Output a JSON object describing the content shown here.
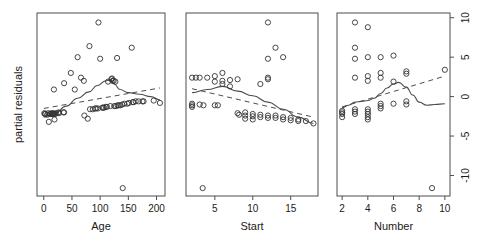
{
  "figure": {
    "ylabel": "partial residuals",
    "panels": [
      {
        "name": "age",
        "xlabel": "Age",
        "xticks": [
          "0",
          "50",
          "100",
          "150",
          "200"
        ],
        "xtick_values": [
          0,
          50,
          100,
          150,
          200
        ],
        "xlim": [
          -12,
          215
        ],
        "show_yaxis": false
      },
      {
        "name": "start",
        "xlabel": "Start",
        "xticks": [
          "5",
          "10",
          "15"
        ],
        "xtick_values": [
          5,
          10,
          15
        ],
        "xlim": [
          1.2,
          18.6
        ],
        "show_yaxis": false
      },
      {
        "name": "number",
        "xlabel": "Number",
        "xticks": [
          "2",
          "4",
          "6",
          "8",
          "10"
        ],
        "xtick_values": [
          2,
          4,
          6,
          8,
          10
        ],
        "xlim": [
          1.6,
          10.4
        ],
        "show_yaxis": true
      }
    ],
    "yticks": [
      "10",
      "5",
      "0",
      "-5",
      "-10"
    ],
    "ytick_values": [
      10,
      5,
      0,
      -5,
      -10
    ],
    "ylim": [
      -12.6,
      10.6
    ]
  },
  "chart_data": [
    {
      "type": "scatter",
      "title": "",
      "xlabel": "Age",
      "ylabel": "partial residuals",
      "xlim": [
        -12,
        215
      ],
      "ylim": [
        -12.6,
        10.6
      ],
      "grid": false,
      "legend": null,
      "marker": "open-circle",
      "points": [
        {
          "x": 1,
          "y": -2.1
        },
        {
          "x": 2,
          "y": -2.2
        },
        {
          "x": 3,
          "y": -2.2
        },
        {
          "x": 6,
          "y": -2.3
        },
        {
          "x": 8,
          "y": -2.1
        },
        {
          "x": 9,
          "y": -3.2
        },
        {
          "x": 11,
          "y": -2.2
        },
        {
          "x": 12,
          "y": -2.2
        },
        {
          "x": 14,
          "y": -2.1
        },
        {
          "x": 15,
          "y": -2.2
        },
        {
          "x": 16,
          "y": -2.2
        },
        {
          "x": 17,
          "y": -2.1
        },
        {
          "x": 18,
          "y": -2.2
        },
        {
          "x": 19,
          "y": -2.9
        },
        {
          "x": 20,
          "y": -2.2
        },
        {
          "x": 22,
          "y": -2.1
        },
        {
          "x": 26,
          "y": -2.0
        },
        {
          "x": 27,
          "y": -2.1
        },
        {
          "x": 35,
          "y": -2.0
        },
        {
          "x": 36,
          "y": -2.0
        },
        {
          "x": 18,
          "y": 0.9
        },
        {
          "x": 36,
          "y": 1.7
        },
        {
          "x": 48,
          "y": 3.0
        },
        {
          "x": 55,
          "y": 0.9
        },
        {
          "x": 60,
          "y": 5.0
        },
        {
          "x": 66,
          "y": 2.4
        },
        {
          "x": 71,
          "y": 2.0
        },
        {
          "x": 72,
          "y": -2.4
        },
        {
          "x": 78,
          "y": -2.8
        },
        {
          "x": 81,
          "y": 6.4
        },
        {
          "x": 82,
          "y": -1.6
        },
        {
          "x": 87,
          "y": -1.6
        },
        {
          "x": 91,
          "y": -1.5
        },
        {
          "x": 93,
          "y": -1.5
        },
        {
          "x": 96,
          "y": -1.5
        },
        {
          "x": 97,
          "y": 9.4
        },
        {
          "x": 100,
          "y": 4.8
        },
        {
          "x": 104,
          "y": -1.4
        },
        {
          "x": 105,
          "y": -1.4
        },
        {
          "x": 107,
          "y": -1.4
        },
        {
          "x": 110,
          "y": -1.3
        },
        {
          "x": 112,
          "y": -1.3
        },
        {
          "x": 114,
          "y": 1.9
        },
        {
          "x": 118,
          "y": -1.2
        },
        {
          "x": 120,
          "y": 2.2
        },
        {
          "x": 121,
          "y": 2.3
        },
        {
          "x": 122,
          "y": 2.0
        },
        {
          "x": 124,
          "y": 2.0
        },
        {
          "x": 125,
          "y": -1.2
        },
        {
          "x": 127,
          "y": 1.9
        },
        {
          "x": 128,
          "y": -1.2
        },
        {
          "x": 130,
          "y": 4.9
        },
        {
          "x": 131,
          "y": -1.1
        },
        {
          "x": 133,
          "y": -1.1
        },
        {
          "x": 136,
          "y": -1.1
        },
        {
          "x": 139,
          "y": -1.0
        },
        {
          "x": 140,
          "y": -11.6
        },
        {
          "x": 143,
          "y": -0.9
        },
        {
          "x": 148,
          "y": -0.9
        },
        {
          "x": 151,
          "y": -0.8
        },
        {
          "x": 156,
          "y": 6.2
        },
        {
          "x": 158,
          "y": -0.7
        },
        {
          "x": 159,
          "y": -0.7
        },
        {
          "x": 163,
          "y": -0.6
        },
        {
          "x": 168,
          "y": -0.6
        },
        {
          "x": 175,
          "y": -0.6
        },
        {
          "x": 177,
          "y": -0.6
        },
        {
          "x": 195,
          "y": -0.5
        },
        {
          "x": 206,
          "y": -0.8
        }
      ],
      "smooth_curve": [
        {
          "x": 0,
          "y": -2.6
        },
        {
          "x": 20,
          "y": -2.1
        },
        {
          "x": 40,
          "y": -1.2
        },
        {
          "x": 60,
          "y": -0.2
        },
        {
          "x": 80,
          "y": 0.6
        },
        {
          "x": 95,
          "y": 1.4
        },
        {
          "x": 110,
          "y": 2.0
        },
        {
          "x": 118,
          "y": 2.1
        },
        {
          "x": 125,
          "y": 1.6
        },
        {
          "x": 135,
          "y": 0.9
        },
        {
          "x": 150,
          "y": 0.5
        },
        {
          "x": 170,
          "y": 0.3
        },
        {
          "x": 190,
          "y": 0.0
        },
        {
          "x": 206,
          "y": -0.4
        }
      ],
      "linear_fit": [
        {
          "x": 0,
          "y": -1.5
        },
        {
          "x": 206,
          "y": 1.1
        }
      ]
    },
    {
      "type": "scatter",
      "title": "",
      "xlabel": "Start",
      "ylabel": "partial residuals",
      "xlim": [
        1.2,
        18.6
      ],
      "ylim": [
        -12.6,
        10.6
      ],
      "grid": false,
      "legend": null,
      "marker": "open-circle",
      "points": [
        {
          "x": 2,
          "y": 2.4
        },
        {
          "x": 2,
          "y": -0.9
        },
        {
          "x": 2,
          "y": -1.1
        },
        {
          "x": 2,
          "y": -1.3
        },
        {
          "x": 2.5,
          "y": 2.4
        },
        {
          "x": 3,
          "y": 2.4
        },
        {
          "x": 3,
          "y": -1.0
        },
        {
          "x": 3.5,
          "y": -1.1
        },
        {
          "x": 3.4,
          "y": -11.6
        },
        {
          "x": 4,
          "y": 2.4
        },
        {
          "x": 5,
          "y": 2.6
        },
        {
          "x": 5,
          "y": 1.9
        },
        {
          "x": 5,
          "y": -1.1
        },
        {
          "x": 5.4,
          "y": -1.1
        },
        {
          "x": 6,
          "y": 3.0
        },
        {
          "x": 6,
          "y": 2.0
        },
        {
          "x": 6,
          "y": 1.6
        },
        {
          "x": 7,
          "y": 2.1
        },
        {
          "x": 7,
          "y": 1.3
        },
        {
          "x": 8,
          "y": 2.2
        },
        {
          "x": 8,
          "y": -2.1
        },
        {
          "x": 8.2,
          "y": -2.3
        },
        {
          "x": 9,
          "y": -2.0
        },
        {
          "x": 9,
          "y": -2.4
        },
        {
          "x": 9,
          "y": -2.8
        },
        {
          "x": 10,
          "y": -2.2
        },
        {
          "x": 10,
          "y": -2.5
        },
        {
          "x": 10,
          "y": -2.9
        },
        {
          "x": 11,
          "y": -2.3
        },
        {
          "x": 11,
          "y": -2.6
        },
        {
          "x": 11,
          "y": 1.6
        },
        {
          "x": 12,
          "y": 9.4
        },
        {
          "x": 12,
          "y": 4.8
        },
        {
          "x": 12,
          "y": 2.4
        },
        {
          "x": 12,
          "y": 2.2
        },
        {
          "x": 12,
          "y": -2.4
        },
        {
          "x": 12,
          "y": -2.7
        },
        {
          "x": 13,
          "y": 6.2
        },
        {
          "x": 13,
          "y": -2.4
        },
        {
          "x": 13,
          "y": -2.7
        },
        {
          "x": 14,
          "y": 5.0
        },
        {
          "x": 14,
          "y": -2.6
        },
        {
          "x": 14,
          "y": -2.9
        },
        {
          "x": 15,
          "y": -2.7
        },
        {
          "x": 15,
          "y": -3.0
        },
        {
          "x": 16,
          "y": -2.9
        },
        {
          "x": 16,
          "y": -3.1
        },
        {
          "x": 17,
          "y": -3.1
        },
        {
          "x": 18,
          "y": -3.4
        }
      ],
      "smooth_curve": [
        {
          "x": 2,
          "y": 0.5
        },
        {
          "x": 4,
          "y": 0.9
        },
        {
          "x": 6,
          "y": 1.3
        },
        {
          "x": 8,
          "y": 0.7
        },
        {
          "x": 10,
          "y": 0.1
        },
        {
          "x": 12,
          "y": -0.7
        },
        {
          "x": 14,
          "y": -1.6
        },
        {
          "x": 16,
          "y": -2.6
        },
        {
          "x": 18,
          "y": -3.4
        }
      ],
      "linear_fit": [
        {
          "x": 2,
          "y": 1.0
        },
        {
          "x": 18,
          "y": -2.6
        }
      ]
    },
    {
      "type": "scatter",
      "title": "",
      "xlabel": "Number",
      "ylabel": "partial residuals",
      "xlim": [
        1.6,
        10.4
      ],
      "ylim": [
        -12.6,
        10.6
      ],
      "grid": false,
      "legend": null,
      "marker": "open-circle",
      "points": [
        {
          "x": 2,
          "y": -1.8
        },
        {
          "x": 2,
          "y": -2.0
        },
        {
          "x": 2,
          "y": -2.2
        },
        {
          "x": 2,
          "y": -2.6
        },
        {
          "x": 3,
          "y": 9.4
        },
        {
          "x": 3,
          "y": 6.2
        },
        {
          "x": 3,
          "y": 4.8
        },
        {
          "x": 3,
          "y": 2.4
        },
        {
          "x": 3,
          "y": -1.6
        },
        {
          "x": 3,
          "y": -1.9
        },
        {
          "x": 3,
          "y": -2.2
        },
        {
          "x": 4,
          "y": 2.6
        },
        {
          "x": 4,
          "y": 2.0
        },
        {
          "x": 4,
          "y": -1.6
        },
        {
          "x": 4,
          "y": -1.9
        },
        {
          "x": 4,
          "y": -2.2
        },
        {
          "x": 4,
          "y": -2.6
        },
        {
          "x": 4,
          "y": -2.9
        },
        {
          "x": 4,
          "y": 8.8
        },
        {
          "x": 4,
          "y": 5.0
        },
        {
          "x": 5,
          "y": 3.0
        },
        {
          "x": 5,
          "y": 2.4
        },
        {
          "x": 5,
          "y": -0.9
        },
        {
          "x": 5,
          "y": -1.2
        },
        {
          "x": 5,
          "y": -1.5
        },
        {
          "x": 5,
          "y": 5.0
        },
        {
          "x": 6,
          "y": 5.2
        },
        {
          "x": 6,
          "y": 1.9
        },
        {
          "x": 6,
          "y": -0.9
        },
        {
          "x": 7,
          "y": 3.2
        },
        {
          "x": 7,
          "y": 2.9
        },
        {
          "x": 7,
          "y": -0.6
        },
        {
          "x": 7,
          "y": -1.0
        },
        {
          "x": 9,
          "y": -11.6
        },
        {
          "x": 10,
          "y": 3.4
        }
      ],
      "smooth_curve": [
        {
          "x": 2,
          "y": -1.4
        },
        {
          "x": 2.5,
          "y": -1.1
        },
        {
          "x": 3,
          "y": -0.7
        },
        {
          "x": 3.5,
          "y": -0.6
        },
        {
          "x": 4,
          "y": -0.5
        },
        {
          "x": 4.5,
          "y": -0.2
        },
        {
          "x": 5,
          "y": 0.4
        },
        {
          "x": 5.5,
          "y": 1.1
        },
        {
          "x": 6,
          "y": 1.6
        },
        {
          "x": 6.4,
          "y": 1.8
        },
        {
          "x": 7,
          "y": 1.2
        },
        {
          "x": 7.5,
          "y": 0.2
        },
        {
          "x": 8,
          "y": -0.7
        },
        {
          "x": 8.6,
          "y": -1.1
        },
        {
          "x": 9.2,
          "y": -1.0
        },
        {
          "x": 10,
          "y": -0.9
        }
      ],
      "linear_fit": [
        {
          "x": 2,
          "y": -1.3
        },
        {
          "x": 10,
          "y": 2.6
        }
      ]
    }
  ]
}
